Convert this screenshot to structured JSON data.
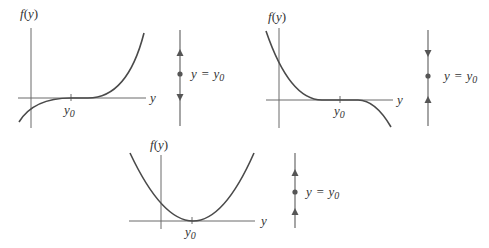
{
  "figure": {
    "panels": [
      {
        "id": "panel-1",
        "axis_y_label": "f(y)",
        "axis_x_label": "y",
        "tick_label": "y0",
        "curve": "cubic-increasing (semi-stable, f >= 0 right, f <= 0 left)",
        "phase_line": {
          "label": "y = y0",
          "arrows": [
            "up",
            "down"
          ],
          "equilibrium": "semi-stable"
        }
      },
      {
        "id": "panel-2",
        "axis_y_label": "f(y)",
        "axis_x_label": "y",
        "tick_label": "y0",
        "curve": "cubic-decreasing",
        "phase_line": {
          "label": "y = y0",
          "arrows": [
            "down",
            "up"
          ],
          "equilibrium": "stable"
        }
      },
      {
        "id": "panel-3",
        "axis_y_label": "f(y)",
        "axis_x_label": "y",
        "tick_label": "y0",
        "curve": "parabola touching axis at y0",
        "phase_line": {
          "label": "y = y0",
          "arrows": [
            "up",
            "up"
          ],
          "equilibrium": "semi-stable"
        }
      }
    ],
    "labels": {
      "fy": "f(y)",
      "f": "f",
      "y_open": "(",
      "y_var": "y",
      "y_close": ")",
      "x": "y",
      "y0_main": "y",
      "y0_sub": "0",
      "eq_lhs": "y",
      "eq_sign": "=",
      "eq_rhs": "y",
      "eq_sub": "0"
    },
    "colors": {
      "curve": "#4a4a4a",
      "axis": "#6a6a6a",
      "text": "#333333"
    }
  }
}
